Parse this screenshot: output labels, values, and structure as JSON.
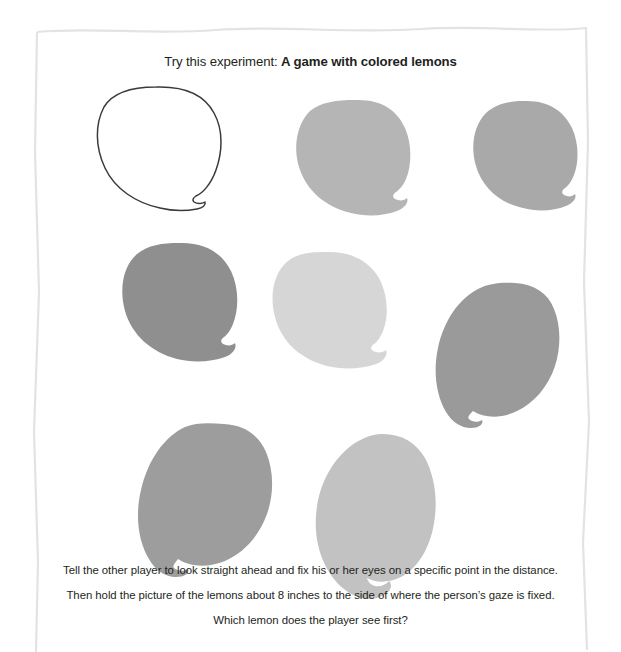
{
  "headline": {
    "lead": "Try this experiment: ",
    "emphasis": "A game with colored lemons"
  },
  "instructions": [
    "Tell the other player to look straight ahead and fix his or her eyes on a specific point in the distance.",
    "Then hold the picture of the lemons about 8 inches to the side of where the person’s gaze is fixed.",
    "Which lemon does the player see first?"
  ],
  "paper": {
    "background_color": "#ffffff",
    "edge_color": "#e3e3e3"
  },
  "lemons": [
    {
      "id": "lemon-1",
      "label": "outline lemon",
      "fill": "none",
      "stroke": "#3a3a3a",
      "row": 1,
      "column": 1,
      "nub_position": "bottom-right"
    },
    {
      "id": "lemon-2",
      "label": "light gray lemon",
      "fill": "#b5b5b5",
      "stroke": "none",
      "row": 1,
      "column": 2,
      "nub_position": "right"
    },
    {
      "id": "lemon-3",
      "label": "medium light gray lemon",
      "fill": "#a9a9a9",
      "stroke": "none",
      "row": 1,
      "column": 3,
      "nub_position": "right"
    },
    {
      "id": "lemon-4",
      "label": "dark gray lemon",
      "fill": "#8f8f8f",
      "stroke": "none",
      "row": 2,
      "column": 1,
      "nub_position": "right"
    },
    {
      "id": "lemon-5",
      "label": "palest gray lemon",
      "fill": "#d6d6d6",
      "stroke": "none",
      "row": 2,
      "column": 2,
      "nub_position": "right"
    },
    {
      "id": "lemon-6",
      "label": "medium dark gray lemon",
      "fill": "#9a9a9a",
      "stroke": "none",
      "row": 2,
      "column": 3,
      "nub_position": "bottom-left"
    },
    {
      "id": "lemon-7",
      "label": "medium gray lemon",
      "fill": "#9d9d9d",
      "stroke": "none",
      "row": 3,
      "column": 1,
      "nub_position": "bottom-left"
    },
    {
      "id": "lemon-8",
      "label": "light medium gray lemon",
      "fill": "#c2c2c2",
      "stroke": "none",
      "row": 3,
      "column": 2,
      "nub_position": "bottom-right"
    }
  ]
}
